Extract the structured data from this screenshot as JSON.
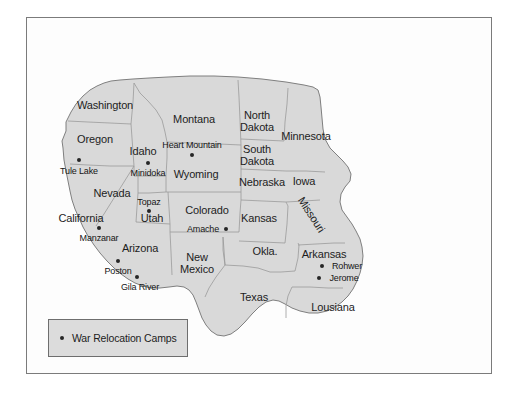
{
  "figure": {
    "domain": "map",
    "caption": ""
  },
  "colors": {
    "page_background": "#ffffff",
    "frame_border": "#7b7b7b",
    "land_fill": "#d9d9d9",
    "state_border": "#9a9a9a",
    "coast_border": "#7f7f7f",
    "label_text": "#1d1d1d",
    "camp_dot": "#262626",
    "legend_fill": "#dcdcdc",
    "legend_border": "#6e6e6e"
  },
  "legend": {
    "label": "War Relocation Camps",
    "marker": "filled-circle"
  },
  "states": [
    {
      "name": "Washington",
      "lines": [
        "Washington"
      ],
      "x": 105,
      "y": 106
    },
    {
      "name": "Oregon",
      "lines": [
        "Oregon"
      ],
      "x": 95,
      "y": 140
    },
    {
      "name": "Idaho",
      "lines": [
        "Idaho"
      ],
      "x": 143,
      "y": 152
    },
    {
      "name": "Montana",
      "lines": [
        "Montana"
      ],
      "x": 194,
      "y": 120
    },
    {
      "name": "North Dakota",
      "lines": [
        "North",
        "Dakota"
      ],
      "x": 257,
      "y": 121
    },
    {
      "name": "South Dakota",
      "lines": [
        "South",
        "Dakota"
      ],
      "x": 257,
      "y": 155
    },
    {
      "name": "Minnesota",
      "lines": [
        "Minnesota"
      ],
      "x": 306,
      "y": 137
    },
    {
      "name": "Wyoming",
      "lines": [
        "Wyoming"
      ],
      "x": 196,
      "y": 175
    },
    {
      "name": "Nebraska",
      "lines": [
        "Nebraska"
      ],
      "x": 262,
      "y": 183
    },
    {
      "name": "Iowa",
      "lines": [
        "Iowa"
      ],
      "x": 304,
      "y": 182
    },
    {
      "name": "Nevada",
      "lines": [
        "Nevada"
      ],
      "x": 112,
      "y": 194
    },
    {
      "name": "Utah",
      "lines": [
        "Utah"
      ],
      "x": 152,
      "y": 219
    },
    {
      "name": "Colorado",
      "lines": [
        "Colorado"
      ],
      "x": 207,
      "y": 211
    },
    {
      "name": "Kansas",
      "lines": [
        "Kansas"
      ],
      "x": 259,
      "y": 219
    },
    {
      "name": "Missouri",
      "lines": [
        "Missouri"
      ],
      "x": 311,
      "y": 215,
      "rotated": true
    },
    {
      "name": "California",
      "lines": [
        "California"
      ],
      "x": 81,
      "y": 219
    },
    {
      "name": "Arizona",
      "lines": [
        "Arizona"
      ],
      "x": 140,
      "y": 249
    },
    {
      "name": "New Mexico",
      "lines": [
        "New",
        "Mexico"
      ],
      "x": 197,
      "y": 263
    },
    {
      "name": "Oklahoma",
      "lines": [
        "Okla."
      ],
      "x": 265,
      "y": 252
    },
    {
      "name": "Arkansas",
      "lines": [
        "Arkansas"
      ],
      "x": 324,
      "y": 255
    },
    {
      "name": "Texas",
      "lines": [
        "Texas"
      ],
      "x": 254,
      "y": 298
    },
    {
      "name": "Louisiana",
      "lines": [
        "Lousiana"
      ],
      "x": 333,
      "y": 308
    }
  ],
  "camps": [
    {
      "name": "Tule Lake",
      "dot_x": 79,
      "dot_y": 160,
      "label_x": 79,
      "label_y": 171
    },
    {
      "name": "Minidoka",
      "dot_x": 148,
      "dot_y": 163,
      "label_x": 148,
      "label_y": 173
    },
    {
      "name": "Heart Mountain",
      "dot_x": 192,
      "dot_y": 155,
      "label_x": 192,
      "label_y": 145
    },
    {
      "name": "Topaz",
      "dot_x": 149,
      "dot_y": 211,
      "label_x": 149,
      "label_y": 202
    },
    {
      "name": "Amache",
      "dot_x": 226,
      "dot_y": 229,
      "label_x": 203,
      "label_y": 229
    },
    {
      "name": "Manzanar",
      "dot_x": 99,
      "dot_y": 228,
      "label_x": 99,
      "label_y": 238
    },
    {
      "name": "Poston",
      "dot_x": 118,
      "dot_y": 261,
      "label_x": 118,
      "label_y": 271
    },
    {
      "name": "Gila River",
      "dot_x": 137,
      "dot_y": 277,
      "label_x": 140,
      "label_y": 287
    },
    {
      "name": "Rohwer",
      "dot_x": 322,
      "dot_y": 266,
      "label_x": 347,
      "label_y": 266
    },
    {
      "name": "Jerome",
      "dot_x": 319,
      "dot_y": 278,
      "label_x": 344,
      "label_y": 278
    }
  ]
}
